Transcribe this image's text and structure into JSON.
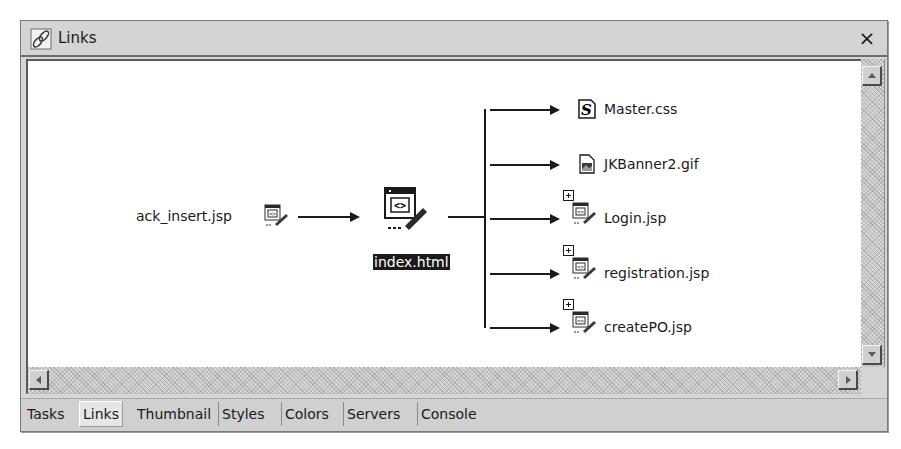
{
  "window": {
    "title": "Links",
    "title_icon": "links-chain-icon",
    "close_glyph": "×"
  },
  "diagram": {
    "incoming": [
      {
        "name": "ack_insert.jsp",
        "icon": "jsp-page-icon"
      }
    ],
    "center": {
      "name": "index.html",
      "icon": "html-page-icon",
      "selected": true
    },
    "outgoing": [
      {
        "name": "Master.css",
        "icon": "css-stylesheet-icon",
        "expandable": false
      },
      {
        "name": "JKBanner2.gif",
        "icon": "gif-image-icon",
        "expandable": false
      },
      {
        "name": "Login.jsp",
        "icon": "jsp-page-icon",
        "expandable": true
      },
      {
        "name": "registration.jsp",
        "icon": "jsp-page-icon",
        "expandable": true
      },
      {
        "name": "createPO.jsp",
        "icon": "jsp-page-icon",
        "expandable": true
      }
    ]
  },
  "tabs": [
    {
      "label": "Tasks",
      "active": false
    },
    {
      "label": "Links",
      "active": true
    },
    {
      "label": "Thumbnail",
      "active": false
    },
    {
      "label": "Styles",
      "active": false
    },
    {
      "label": "Colors",
      "active": false
    },
    {
      "label": "Servers",
      "active": false
    },
    {
      "label": "Console",
      "active": false
    }
  ]
}
